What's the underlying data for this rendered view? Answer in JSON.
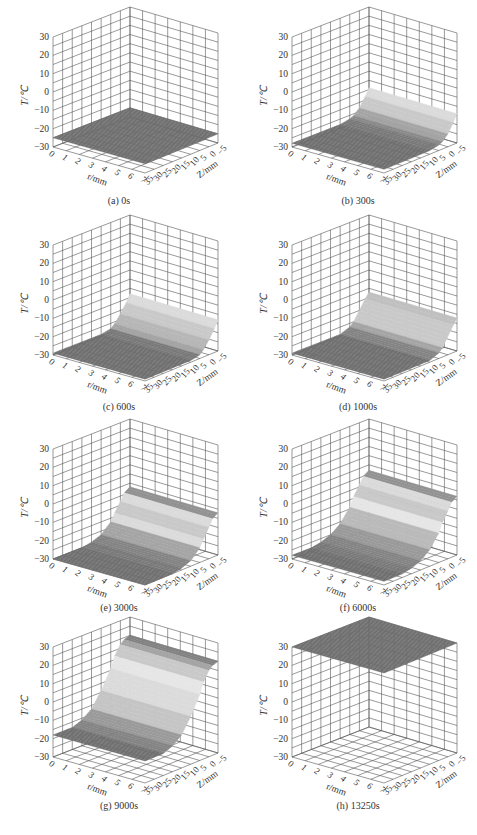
{
  "figure": {
    "caption": "",
    "panels_layout": "4 rows x 2 columns"
  },
  "chart_data": [
    {
      "type": "surface3d",
      "panel": "a",
      "title": "(a) 0s",
      "time_s": 0,
      "xlabel": "r/mm",
      "ylabel": "Z/mm",
      "zlabel": "T/℃",
      "x_ticks": [
        0,
        1,
        2,
        3,
        4,
        5,
        6,
        7
      ],
      "y_ticks": [
        -5,
        0,
        5,
        10,
        15,
        20,
        25,
        30,
        35
      ],
      "z_ticks": [
        -30,
        -20,
        -10,
        0,
        10,
        20,
        30
      ],
      "zlim": [
        -30,
        30
      ],
      "grid": true,
      "profile_along_z": {
        "z": [
          -5,
          0,
          5,
          10,
          15,
          20,
          25,
          30,
          35
        ],
        "T": [
          -25,
          -25,
          -25,
          -25,
          -25,
          -25,
          -25,
          -25,
          -25
        ]
      },
      "note": "uniform flat surface at about -25 ℃"
    },
    {
      "type": "surface3d",
      "panel": "b",
      "title": "(b) 300s",
      "time_s": 300,
      "xlabel": "r/mm",
      "ylabel": "Z/mm",
      "zlabel": "T/℃",
      "x_ticks": [
        0,
        1,
        2,
        3,
        4,
        5,
        6,
        7
      ],
      "y_ticks": [
        -5,
        0,
        5,
        10,
        15,
        20,
        25,
        30,
        35
      ],
      "z_ticks": [
        -30,
        -20,
        -10,
        0,
        10,
        20,
        30
      ],
      "zlim": [
        -30,
        30
      ],
      "grid": true,
      "profile_along_z": {
        "z": [
          -5,
          -3,
          0,
          3,
          5,
          10,
          15,
          20,
          25,
          30,
          35
        ],
        "T": [
          -14,
          -18,
          -23,
          -26,
          -27,
          -28,
          -28,
          -28,
          -28,
          -28,
          -28
        ]
      }
    },
    {
      "type": "surface3d",
      "panel": "c",
      "title": "(c) 600s",
      "time_s": 600,
      "xlabel": "r/mm",
      "ylabel": "Z/mm",
      "zlabel": "T/℃",
      "x_ticks": [
        0,
        1,
        2,
        3,
        4,
        5,
        6,
        7
      ],
      "y_ticks": [
        -5,
        0,
        5,
        10,
        15,
        20,
        25,
        30,
        35
      ],
      "z_ticks": [
        -30,
        -20,
        -10,
        0,
        10,
        20,
        30
      ],
      "zlim": [
        -30,
        30
      ],
      "grid": true,
      "profile_along_z": {
        "z": [
          -5,
          -3,
          0,
          3,
          5,
          10,
          15,
          20,
          25,
          30,
          35
        ],
        "T": [
          -13,
          -17,
          -22,
          -26,
          -28,
          -29,
          -29,
          -29,
          -29,
          -29,
          -29
        ]
      }
    },
    {
      "type": "surface3d",
      "panel": "d",
      "title": "(d) 1000s",
      "time_s": 1000,
      "xlabel": "r/mm",
      "ylabel": "Z/mm",
      "zlabel": "T/℃",
      "x_ticks": [
        0,
        1,
        2,
        3,
        4,
        5,
        6,
        7
      ],
      "y_ticks": [
        -5,
        0,
        5,
        10,
        15,
        20,
        25,
        30,
        35
      ],
      "z_ticks": [
        -30,
        -20,
        -10,
        0,
        10,
        20,
        30
      ],
      "zlim": [
        -30,
        30
      ],
      "grid": true,
      "profile_along_z": {
        "z": [
          -5,
          -3,
          0,
          3,
          5,
          10,
          15,
          20,
          25,
          30,
          35
        ],
        "T": [
          -12,
          -15,
          -20,
          -25,
          -27,
          -29,
          -29,
          -29,
          -29,
          -29,
          -29
        ]
      }
    },
    {
      "type": "surface3d",
      "panel": "e",
      "title": "(e) 3000s",
      "time_s": 3000,
      "xlabel": "r/mm",
      "ylabel": "Z/mm",
      "zlabel": "T/℃",
      "x_ticks": [
        0,
        1,
        2,
        3,
        4,
        5,
        6,
        7
      ],
      "y_ticks": [
        -5,
        0,
        5,
        10,
        15,
        20,
        25,
        30,
        35
      ],
      "z_ticks": [
        -30,
        -20,
        -10,
        0,
        10,
        20,
        30
      ],
      "zlim": [
        -30,
        30
      ],
      "grid": true,
      "profile_along_z": {
        "z": [
          -5,
          -2,
          0,
          3,
          5,
          10,
          15,
          20,
          25,
          30,
          35
        ],
        "T": [
          -7,
          -9,
          -13,
          -18,
          -22,
          -27,
          -29,
          -30,
          -30,
          -30,
          -30
        ]
      }
    },
    {
      "type": "surface3d",
      "panel": "f",
      "title": "(f) 6000s",
      "time_s": 6000,
      "xlabel": "r/mm",
      "ylabel": "Z/mm",
      "zlabel": "T/℃",
      "x_ticks": [
        0,
        1,
        2,
        3,
        4,
        5,
        6,
        7
      ],
      "y_ticks": [
        -5,
        0,
        5,
        10,
        15,
        20,
        25,
        30,
        35
      ],
      "z_ticks": [
        -30,
        -20,
        -10,
        0,
        10,
        20,
        30
      ],
      "zlim": [
        -30,
        30
      ],
      "grid": true,
      "profile_along_z": {
        "z": [
          -5,
          -2,
          0,
          3,
          5,
          10,
          15,
          20,
          25,
          30,
          35
        ],
        "T": [
          2,
          0,
          -4,
          -9,
          -14,
          -21,
          -25,
          -27,
          -28,
          -28,
          -28
        ]
      }
    },
    {
      "type": "surface3d",
      "panel": "g",
      "title": "(g) 9000s",
      "time_s": 9000,
      "xlabel": "r/mm",
      "ylabel": "Z/mm",
      "zlabel": "T/℃",
      "x_ticks": [
        0,
        1,
        2,
        3,
        4,
        5,
        6,
        7
      ],
      "y_ticks": [
        -5,
        0,
        5,
        10,
        15,
        20,
        25,
        30,
        35
      ],
      "z_ticks": [
        -30,
        -20,
        -10,
        0,
        10,
        20,
        30
      ],
      "zlim": [
        -30,
        30
      ],
      "grid": true,
      "profile_along_z": {
        "z": [
          -5,
          -2,
          0,
          3,
          5,
          10,
          15,
          20,
          25,
          30,
          35
        ],
        "T": [
          20,
          19,
          17,
          12,
          6,
          -4,
          -12,
          -16,
          -18,
          -18,
          -18
        ]
      }
    },
    {
      "type": "surface3d",
      "panel": "h",
      "title": "(h) 13250s",
      "time_s": 13250,
      "xlabel": "r/mm",
      "ylabel": "Z/mm",
      "zlabel": "T/℃",
      "x_ticks": [
        0,
        1,
        2,
        3,
        4,
        5,
        6,
        7
      ],
      "y_ticks": [
        -5,
        0,
        5,
        10,
        15,
        20,
        25,
        30,
        35
      ],
      "z_ticks": [
        -30,
        -20,
        -10,
        0,
        10,
        20,
        30
      ],
      "zlim": [
        -30,
        30
      ],
      "grid": true,
      "profile_along_z": {
        "z": [
          -5,
          0,
          5,
          10,
          15,
          20,
          25,
          30,
          35
        ],
        "T": [
          30,
          30,
          30,
          30,
          30,
          30,
          30,
          30,
          30
        ]
      },
      "note": "uniform flat surface at about 30 ℃"
    }
  ],
  "colors": {
    "grid": "#555555",
    "surface_dark": "#6e6e6e",
    "surface_light": "#e4e4e4",
    "text": "#333333"
  }
}
